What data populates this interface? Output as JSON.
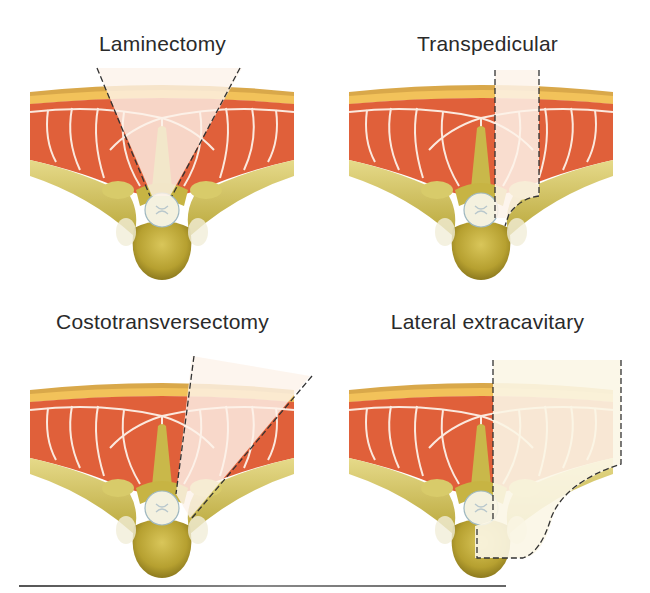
{
  "figure": {
    "panels": [
      {
        "id": "laminectomy",
        "label": "Laminectomy"
      },
      {
        "id": "transpedicular",
        "label": "Transpedicular"
      },
      {
        "id": "costotransversectomy",
        "label": "Costotransversectomy"
      },
      {
        "id": "lateral-extracavitary",
        "label": "Lateral extracavitary"
      }
    ],
    "colors": {
      "muscle": "#e0603a",
      "muscle_faded": "#f6d6cc",
      "fat": "#f2c25a",
      "skin": "#d9a84a",
      "bone": "#bfae3c",
      "bone_light": "#e8df9a",
      "cord": "#f4f1df",
      "fascia": "#ffffff",
      "dashed_line": "#333333"
    }
  }
}
